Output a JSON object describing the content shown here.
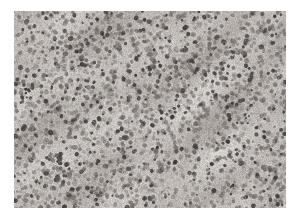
{
  "figure": {
    "kind": "histopathology-micrograph",
    "caption": "",
    "border_color": "#ffffff",
    "border_left_px": 14,
    "border_top_px": 11,
    "plate": {
      "x": 14,
      "y": 11,
      "width": 272,
      "height": 197
    }
  },
  "image_data": {
    "type": "texture",
    "modality": "brightfield-light-microscopy",
    "stain": "H&E",
    "appearance": "near-grayscale with faint warm tint",
    "palette": {
      "background_light": "#d8d4d0",
      "background_mid": "#bdb8b4",
      "background_dark": "#a09a96",
      "nucleus_dark": "#4a4644",
      "nucleus_mid": "#6e6864",
      "highlight": "#e8e5e2"
    },
    "tone": {
      "min_luma": 48,
      "mean_luma": 178,
      "max_luma": 238,
      "saturation": "very-low"
    },
    "cellularity": "high",
    "nuclei": {
      "count_estimate": 2600,
      "diameter_px_min": 2,
      "diameter_px_max": 5,
      "shape": "round-to-oval",
      "distribution": "diffuse, uniformly scattered, mildly clustered"
    },
    "stroma": {
      "pattern": "fine fibrillar interstitial background",
      "pale_zones": [
        {
          "cx": 0.42,
          "cy": 0.55,
          "r": 0.22
        },
        {
          "cx": 0.18,
          "cy": 0.3,
          "r": 0.16
        },
        {
          "cx": 0.74,
          "cy": 0.72,
          "r": 0.18
        }
      ]
    },
    "noise": {
      "grain": "moderate film/scan grain",
      "vignette": "slight darkening toward upper right"
    },
    "seed": 20240517
  }
}
